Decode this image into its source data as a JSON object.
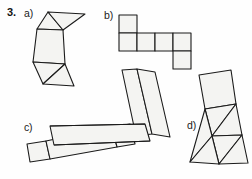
{
  "page": {
    "background_color": "#fefefe",
    "stroke_color": "#1b1b1b",
    "fill_color": "#f4f4f2"
  },
  "exercise": {
    "number": "3."
  },
  "parts": [
    {
      "key": "a",
      "label": "a)"
    },
    {
      "key": "b",
      "label": "b)"
    },
    {
      "key": "c",
      "label": "c)"
    },
    {
      "key": "d",
      "label": "d)"
    }
  ],
  "figures": {
    "a": {
      "name": "net-square-and-triangles",
      "description": "Tilted net: two triangles at top, a square in the middle, two triangles at the bottom",
      "polygons": [
        {
          "name": "triangle-top-left",
          "points": "37,29 48,12 63,30"
        },
        {
          "name": "triangle-top-right",
          "points": "48,12 85,14 63,30"
        },
        {
          "name": "square-middle",
          "points": "37,29 63,30 65,64 33,62"
        },
        {
          "name": "triangle-bottom-left",
          "points": "33,62 65,64 43,84"
        },
        {
          "name": "triangle-bottom-right",
          "points": "65,64 74,86 43,84"
        }
      ]
    },
    "b": {
      "name": "net-six-squares-cross",
      "description": "Net of a cube: one square above the first cell of a row of four squares, and one square below the fourth cell",
      "polygons": [
        {
          "name": "square-top",
          "points": "119,15 137,15 137,33 119,33"
        },
        {
          "name": "square-row-1",
          "points": "119,33 137,33 137,51 119,51"
        },
        {
          "name": "square-row-2",
          "points": "137,33 155,33 155,51 137,51"
        },
        {
          "name": "square-row-3",
          "points": "155,33 173,33 173,51 155,51"
        },
        {
          "name": "square-row-4",
          "points": "173,33 191,33 191,51 173,51"
        },
        {
          "name": "square-bottom",
          "points": "173,51 191,51 191,69 173,69"
        }
      ]
    },
    "c": {
      "name": "net-rectangular-prism",
      "description": "Tilted net of a rectangular prism: two long rectangles running diagonally up-right crossing a row of three rectangles running to the lower right",
      "polygons": [
        {
          "name": "rect-vertical-left",
          "points": "122,70 137,69 152,134 136,136"
        },
        {
          "name": "rect-vertical-right",
          "points": "137,69 155,72 170,137 152,134"
        },
        {
          "name": "rect-horizontal-1",
          "points": "27,144 46,141 50,159 30,162"
        },
        {
          "name": "rect-horizontal-2",
          "points": "46,141 112,127 117,147 50,159"
        },
        {
          "name": "rect-horizontal-3",
          "points": "112,127 130,124 135,144 117,147"
        },
        {
          "name": "rect-top-strip",
          "points": "50,126 145,124 150,141 54,145"
        }
      ],
      "strokes": [
        {
          "name": "edge-top-band-upper",
          "points": "50,126 145,124"
        },
        {
          "name": "edge-top-band-lower",
          "points": "54,145 150,141"
        }
      ]
    },
    "d": {
      "name": "net-square-pyramid",
      "description": "Tilted net: a square at the top with triangles fanning out below it",
      "polygons": [
        {
          "name": "square-top",
          "points": "199,75 231,70 236,104 205,109"
        },
        {
          "name": "triangle-upper-left",
          "points": "205,109 236,104 212,136"
        },
        {
          "name": "triangle-upper-right",
          "points": "236,104 242,135 212,136"
        },
        {
          "name": "triangle-lower-left",
          "points": "212,136 242,135 219,164"
        },
        {
          "name": "triangle-lower-right",
          "points": "242,135 248,163 219,164"
        },
        {
          "name": "triangle-left-fin",
          "points": "205,109 212,136 190,162"
        },
        {
          "name": "triangle-left-fin-2",
          "points": "190,162 212,136 219,164"
        }
      ]
    }
  }
}
